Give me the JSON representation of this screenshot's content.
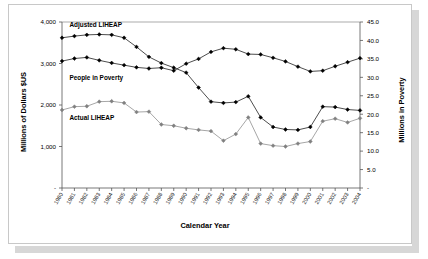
{
  "chart_data": {
    "type": "line",
    "title": "",
    "xlabel": "Calendar Year",
    "ylabel": "Millions of Dollars $US",
    "y2label": "Millions in Poverty",
    "grid": false,
    "legend": "inline-annotations",
    "x": [
      1980,
      1981,
      1982,
      1983,
      1984,
      1985,
      1986,
      1987,
      1988,
      1989,
      1990,
      1991,
      1992,
      1993,
      1994,
      1995,
      1996,
      1997,
      1998,
      1999,
      2000,
      2001,
      2002,
      2003,
      2004
    ],
    "xtick_labels": [
      "1980",
      "1981",
      "1982",
      "1983",
      "1984",
      "1985",
      "1986",
      "1987",
      "1988",
      "1989",
      "1990",
      "1991",
      "1992",
      "1993",
      "1994",
      "1995",
      "1996",
      "1997",
      "1998",
      "1999",
      "2000",
      "2001",
      "2002",
      "2003",
      "2004"
    ],
    "ylim": [
      0,
      4000
    ],
    "ytick_labels": [
      "-",
      "1,000",
      "2,000",
      "3,000",
      "4,000"
    ],
    "ytick_values": [
      0,
      1000,
      2000,
      3000,
      4000
    ],
    "y2lim": [
      0,
      45
    ],
    "y2tick_labels": [
      "-",
      "5.0",
      "10.0",
      "15.0",
      "20.0",
      "25.0",
      "30.0",
      "35.0",
      "40.0",
      "45.0"
    ],
    "y2tick_values": [
      0,
      5,
      10,
      15,
      20,
      25,
      30,
      35,
      40,
      45
    ],
    "series": [
      {
        "name": "Adjusted LIHEAP",
        "axis": "left",
        "color": "#000000",
        "marker": "filled-diamond",
        "label_x": 1980.6,
        "label_y": 3890,
        "values": [
          3620,
          3660,
          3690,
          3700,
          3690,
          3620,
          3400,
          3160,
          3010,
          2900,
          2780,
          2420,
          2080,
          2050,
          2070,
          2210,
          1700,
          1470,
          1410,
          1400,
          1470,
          1960,
          1950,
          1890,
          1870
        ]
      },
      {
        "name": "People in Poverty",
        "axis": "right",
        "color": "#000000",
        "marker": "filled-diamond",
        "label_x": 1980.6,
        "label_y": 2600,
        "values": [
          34.4,
          35.1,
          35.4,
          34.6,
          33.9,
          33.3,
          32.7,
          32.4,
          32.6,
          31.8,
          33.7,
          35.0,
          36.9,
          37.9,
          37.6,
          36.3,
          36.2,
          35.3,
          34.3,
          32.9,
          31.6,
          31.8,
          33.0,
          34.1,
          35.2
        ]
      },
      {
        "name": "Actual LIHEAP",
        "axis": "left",
        "color": "#808080",
        "marker": "filled-diamond",
        "label_x": 1980.6,
        "label_y": 1640,
        "values": [
          1880,
          1960,
          1970,
          2080,
          2090,
          2050,
          1830,
          1840,
          1530,
          1500,
          1440,
          1400,
          1370,
          1140,
          1300,
          1700,
          1070,
          1020,
          1000,
          1070,
          1120,
          1610,
          1670,
          1580,
          1680
        ]
      }
    ]
  }
}
